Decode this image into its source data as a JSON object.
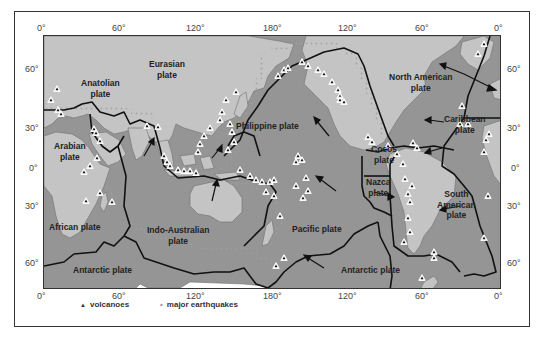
{
  "map": {
    "title": "Tectonic plates, volcanoes and major earthquakes",
    "colors": {
      "ocean": "#8f8f8f",
      "land": "#c4c4c4",
      "shelf": "#b0b0b0",
      "boundary": "#111111",
      "volcano_fill": "#ffffff",
      "earthquake": "#9a9a9a"
    },
    "top_axis": [
      "0°",
      "60°",
      "120°",
      "180°",
      "120°",
      "60°",
      "0°"
    ],
    "bottom_axis": [
      "0°",
      "60°",
      "120°",
      "180°",
      "120°",
      "60°",
      "0°"
    ],
    "left_axis": [
      "60°",
      "30°",
      "0°",
      "30°",
      "60°"
    ],
    "right_axis": [
      "60°",
      "30°",
      "0°",
      "30°",
      "60°"
    ],
    "plates": [
      {
        "id": "eurasian",
        "line1": "Eurasian",
        "line2": "plate"
      },
      {
        "id": "anatolian",
        "line1": "Anatolian",
        "line2": "plate"
      },
      {
        "id": "arabian",
        "line1": "Arabian",
        "line2": "plate"
      },
      {
        "id": "african",
        "line1": "African plate",
        "line2": ""
      },
      {
        "id": "indo-australian",
        "line1": "Indo-Australian",
        "line2": "plate"
      },
      {
        "id": "philippine",
        "line1": "Philippine plate",
        "line2": ""
      },
      {
        "id": "pacific",
        "line1": "Pacific plate",
        "line2": ""
      },
      {
        "id": "north-american",
        "line1": "North American",
        "line2": "plate"
      },
      {
        "id": "caribbean",
        "line1": "Caribbean",
        "line2": "plate"
      },
      {
        "id": "cocos",
        "line1": "Cocos",
        "line2": "plate"
      },
      {
        "id": "nazca",
        "line1": "Nazca",
        "line2": "plate"
      },
      {
        "id": "south-american",
        "line1": "South",
        "line2": "American",
        "line3": "plate"
      },
      {
        "id": "antarctic-west",
        "line1": "Antarctic plate",
        "line2": ""
      },
      {
        "id": "antarctic-east",
        "line1": "Antarctic plate",
        "line2": ""
      }
    ]
  },
  "legend": {
    "volcanoes_symbol": "▲",
    "volcanoes_label": "volcanoes",
    "earthquakes_symbol": "•",
    "earthquakes_label": "major earthquakes"
  }
}
